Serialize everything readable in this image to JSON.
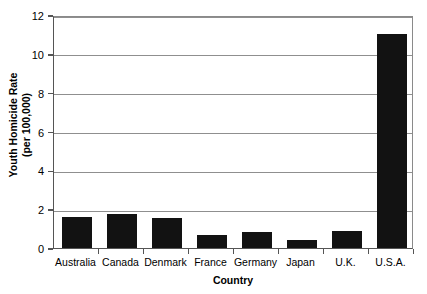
{
  "chart_data": {
    "type": "bar",
    "title": "",
    "subtitle": "",
    "xlabel": "Country",
    "ylabel": "Youth Homicide Rate (per 100,000)",
    "ylabel_lines": [
      "Youth Homicide Rate",
      "(per 100,000)"
    ],
    "categories": [
      "Australia",
      "Canada",
      "Denmark",
      "France",
      "Germany",
      "Japan",
      "U.K.",
      "U.S.A."
    ],
    "values": [
      1.6,
      1.75,
      1.55,
      0.65,
      0.8,
      0.4,
      0.9,
      11.0
    ],
    "ylim": [
      0,
      12
    ],
    "y_ticks": [
      0,
      2,
      4,
      6,
      8,
      10,
      12
    ],
    "y_tick_labels": [
      "0",
      "2",
      "4",
      "6",
      "8",
      "10",
      "12"
    ],
    "grid": "horizontal",
    "legend": "none",
    "bar_color": "#121212",
    "grid_color": "#8f8f8f",
    "axis_color": "#555555",
    "background_color": "#ffffff"
  }
}
